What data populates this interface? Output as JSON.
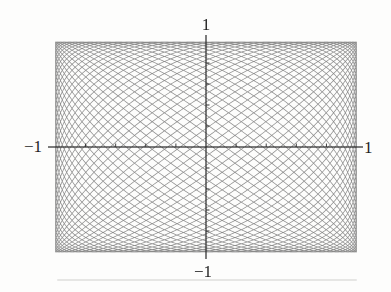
{
  "chart_data": {
    "type": "line",
    "subtype": "parametric-lissajous-curve",
    "title": "",
    "equations": {
      "x": "x(t) = sin(71 t)",
      "y": "y(t) = sin(73 t)"
    },
    "params": {
      "a": 71,
      "b": 73,
      "t_min": 0,
      "t_max": 6.283185307179586,
      "samples": 42000
    },
    "xlim": [
      -1,
      1
    ],
    "ylim": [
      -1,
      1
    ],
    "x_ticks_labeled": [
      -1,
      1
    ],
    "y_ticks_labeled": [
      -1,
      1
    ],
    "unlabeled_tick_step": 0.2,
    "grid": false,
    "legend": null,
    "axes_style": "crossed-at-origin",
    "x_tick_labels": {
      "min": "−1",
      "max": "1"
    },
    "y_tick_labels": {
      "min": "−1",
      "max": "1"
    }
  },
  "colors": {
    "curve": "rgba(100,100,100,0.75)",
    "axis": "#2f2f2f",
    "label_text": "#1f1f1f",
    "background": "#fdfdfc"
  }
}
